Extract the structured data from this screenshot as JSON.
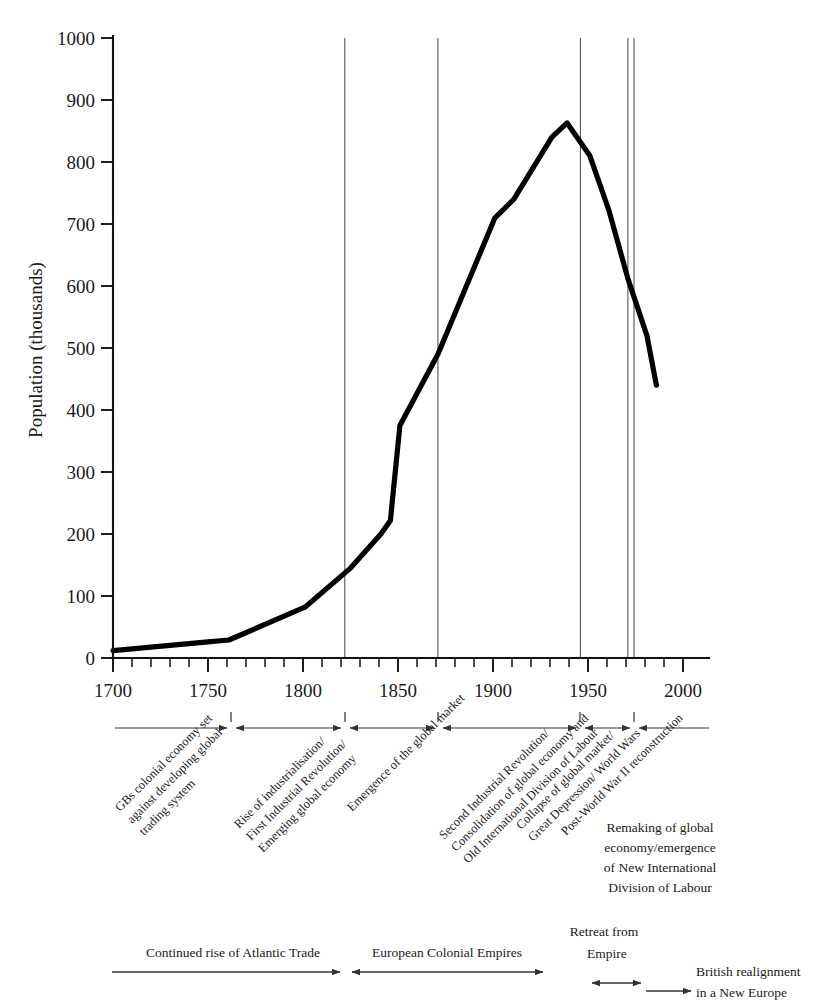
{
  "chart_data": {
    "type": "line",
    "title": "",
    "xlabel": "",
    "ylabel": "Population (thousands)",
    "xlim": [
      1700,
      2008
    ],
    "ylim": [
      0,
      1000
    ],
    "grid": false,
    "legend": "none",
    "x_ticks": [
      1700,
      1750,
      1800,
      1850,
      1900,
      1950,
      2000
    ],
    "x_tick_labels": [
      "1700",
      "1750",
      "1800",
      "1850",
      "1900",
      "1950",
      "2000"
    ],
    "x_minor_step": 10,
    "y_ticks": [
      0,
      100,
      200,
      300,
      400,
      500,
      600,
      700,
      800,
      900,
      1000
    ],
    "y_tick_labels": [
      "0",
      "100",
      "200",
      "300",
      "400",
      "500",
      "600",
      "700",
      "800",
      "900",
      "1000"
    ],
    "series": [
      {
        "name": "Population (thousands)",
        "x": [
          1700,
          1750,
          1761,
          1801,
          1825,
          1841,
          1846,
          1851,
          1871,
          1901,
          1911,
          1921,
          1931,
          1939,
          1951,
          1961,
          1971,
          1981,
          1986
        ],
        "values": [
          12,
          26,
          29,
          82,
          145,
          200,
          222,
          375,
          490,
          710,
          740,
          790,
          840,
          863,
          810,
          722,
          612,
          520,
          440
        ]
      }
    ],
    "vertical_dividers": [
      1762,
      1822,
      1871,
      1946,
      1971
    ],
    "annotations": [
      "GBs colonial economy set against developing global trading system",
      "Rise of industrialisation/ First Industrial Revolution/ Emerging global economy",
      "Emergence of the global market",
      "Second Industrial Revolution/ Consolidation of global economy and Old International Division of Labour",
      "Collapse of global market/ Great Depression/ World Wars",
      "Post-World War II reconstruction",
      "Remaking of global economy/emergence of New International Division of Labour",
      "Continued rise of Atlantic Trade",
      "European Colonial Empires",
      "Retreat from Empire",
      "British realignment in a New Europe"
    ]
  },
  "axes": {
    "y_title": "Population (thousands)",
    "y_tick_labels": [
      "1000",
      "900",
      "800",
      "700",
      "600",
      "500",
      "400",
      "300",
      "200",
      "100",
      "0"
    ],
    "x_tick_labels": [
      "1700",
      "1750",
      "1800",
      "1850",
      "1900",
      "1950",
      "2000"
    ]
  },
  "era_labels": {
    "rotated": [
      {
        "id": "era-1",
        "lines": [
          "GBs colonial economy set",
          "against developing global",
          "trading system"
        ]
      },
      {
        "id": "era-2",
        "lines": [
          "Rise of industrialisation/",
          "First Industrial Revolution/",
          "Emerging global economy"
        ]
      },
      {
        "id": "era-3",
        "lines": [
          "Emergence of the global market"
        ]
      },
      {
        "id": "era-4",
        "lines": [
          "Second Industrial Revolution/",
          "Consolidation of global economy and",
          "Old International Division of Labour"
        ]
      },
      {
        "id": "era-5",
        "lines": [
          "Collapse of global market/",
          "Great Depression/ World Wars"
        ]
      },
      {
        "id": "era-6",
        "lines": [
          "Post-World War II reconstruction"
        ]
      }
    ],
    "horizontal": {
      "id": "era-7",
      "lines": [
        "Remaking of global",
        "economy/emergence",
        "of New International",
        "Division of Labour"
      ]
    }
  },
  "bottom_bands": [
    {
      "id": "band-atlantic-trade",
      "label": "Continued rise of Atlantic Trade"
    },
    {
      "id": "band-colonial-empires",
      "label": "European Colonial Empires"
    },
    {
      "id": "band-retreat-empire",
      "label": "Retreat from",
      "label2": "Empire"
    },
    {
      "id": "band-british-realignment",
      "label": "British realignment",
      "label2": "in a New Europe"
    }
  ],
  "colors": {
    "line": "#000000",
    "axis": "#111111",
    "divider": "#555555",
    "text": "#1a1a1a",
    "background": "#ffffff"
  }
}
